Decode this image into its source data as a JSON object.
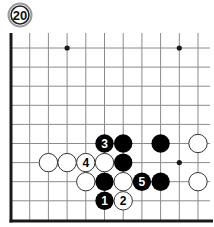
{
  "problem": {
    "number_label": "20"
  },
  "board": {
    "origin_x": 11,
    "origin_y": 48,
    "spacing_x": 18.7,
    "spacing_y": 19.1,
    "cols": 11,
    "rows": 9,
    "top_open_y": 33,
    "right_open_x": 210,
    "bottom_edge_y": 221,
    "stone_radius": 9.2,
    "colors": {
      "line": "#8a8a8a",
      "edge": "#1a1a1a",
      "black": "#000000",
      "white": "#ffffff",
      "white_stroke": "#333333",
      "star": "#1a1a1a"
    },
    "star_points": [
      {
        "c": 3,
        "r": 0
      },
      {
        "c": 9,
        "r": 0
      },
      {
        "c": 9,
        "r": 6
      }
    ],
    "stones": [
      {
        "c": 5,
        "r": 5,
        "color": "black",
        "label": "3"
      },
      {
        "c": 6,
        "r": 5,
        "color": "black",
        "label": ""
      },
      {
        "c": 8,
        "r": 5,
        "color": "black",
        "label": ""
      },
      {
        "c": 10,
        "r": 5,
        "color": "white",
        "label": ""
      },
      {
        "c": 2,
        "r": 6,
        "color": "white",
        "label": ""
      },
      {
        "c": 3,
        "r": 6,
        "color": "white",
        "label": ""
      },
      {
        "c": 4,
        "r": 6,
        "color": "white",
        "label": "4"
      },
      {
        "c": 5,
        "r": 6,
        "color": "white",
        "label": ""
      },
      {
        "c": 6,
        "r": 6,
        "color": "black",
        "label": ""
      },
      {
        "c": 4,
        "r": 7,
        "color": "white",
        "label": ""
      },
      {
        "c": 5,
        "r": 7,
        "color": "black",
        "label": ""
      },
      {
        "c": 6,
        "r": 7,
        "color": "white",
        "label": ""
      },
      {
        "c": 7,
        "r": 7,
        "color": "black",
        "label": "5"
      },
      {
        "c": 8,
        "r": 7,
        "color": "black",
        "label": ""
      },
      {
        "c": 10,
        "r": 7,
        "color": "white",
        "label": ""
      },
      {
        "c": 5,
        "r": 8,
        "color": "black",
        "label": "1"
      },
      {
        "c": 6,
        "r": 8,
        "color": "white",
        "label": "2"
      }
    ]
  }
}
